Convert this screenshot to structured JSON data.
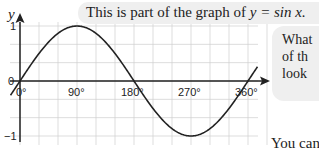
{
  "caption": {
    "prefix": "This is part of the graph of",
    "equation": "y = sin x."
  },
  "side_note": {
    "lines": [
      "What",
      "of th",
      "look"
    ]
  },
  "footer_text": "You can",
  "chart_data": {
    "type": "line",
    "title": "This is part of the graph of y = sin x.",
    "xlabel": "x",
    "ylabel": "y",
    "x_ticks": [
      "0°",
      "90°",
      "180°",
      "270°",
      "360°"
    ],
    "y_ticks": [
      "1",
      "0",
      "−1"
    ],
    "xlim": [
      -15,
      375
    ],
    "ylim": [
      -1.05,
      1.05
    ],
    "grid": true,
    "grid_step_x_degrees": 30,
    "grid_step_y": 0.333,
    "series": [
      {
        "name": "y = sin x",
        "x": [
          -15,
          0,
          30,
          60,
          90,
          120,
          150,
          180,
          210,
          240,
          270,
          300,
          330,
          360,
          375
        ],
        "values": [
          -0.26,
          0,
          0.5,
          0.87,
          1,
          0.87,
          0.5,
          0,
          -0.5,
          -0.87,
          -1,
          -0.87,
          -0.5,
          0,
          0.26
        ]
      }
    ]
  }
}
